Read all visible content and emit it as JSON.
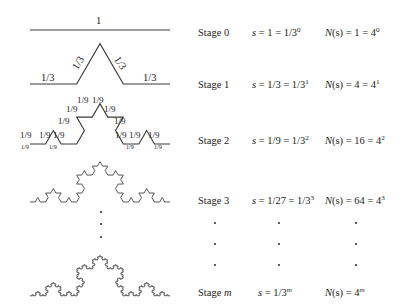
{
  "figure": {
    "line_color": "#3a3a3a",
    "background": "#ffffff"
  },
  "rows": [
    {
      "stage_label": "Stage 0",
      "s_prefix": "s",
      "s_value": "= 1 = 1/3",
      "s_exp": "0",
      "n_prefix": "N",
      "n_arg": "(s)",
      "n_value": "= 1 = 4",
      "n_exp": "0",
      "iteration": 0,
      "segment_label": "1",
      "segment_count": 1
    },
    {
      "stage_label": "Stage 1",
      "s_prefix": "s",
      "s_value": "= 1/3 = 1/3",
      "s_exp": "1",
      "n_prefix": "N",
      "n_arg": "(s)",
      "n_value": "= 4 = 4",
      "n_exp": "1",
      "iteration": 1,
      "segment_label": "1/3",
      "segment_count": 4
    },
    {
      "stage_label": "Stage 2",
      "s_prefix": "s",
      "s_value": "= 1/9 = 1/3",
      "s_exp": "2",
      "n_prefix": "N",
      "n_arg": "(s)",
      "n_value": "= 16 = 4",
      "n_exp": "2",
      "iteration": 2,
      "segment_label": "1/9",
      "segment_count": 16
    },
    {
      "stage_label": "Stage 3",
      "s_prefix": "s",
      "s_value": "= 1/27 = 1/3",
      "s_exp": "3",
      "n_prefix": "N",
      "n_arg": "(s)",
      "n_value": "= 64 = 4",
      "n_exp": "3",
      "iteration": 3,
      "segment_label": "",
      "segment_count": 64
    },
    {
      "stage_label": "Stage m",
      "stage_label_prefix": "Stage ",
      "stage_label_var": "m",
      "s_prefix": "s",
      "s_value": "= 1/3",
      "s_exp": "m",
      "n_prefix": "N",
      "n_arg": "(s)",
      "n_value": "= 4",
      "n_exp": "m",
      "iteration": 5,
      "segment_label": "",
      "segment_count": 1024
    }
  ],
  "stage1_labels": [
    "1/3",
    "1/3",
    "1/3",
    "1/3"
  ],
  "stage2_labels": [
    "1/9",
    "1/9",
    "1/9",
    "1/9",
    "1/9",
    "1/9",
    "1/9",
    "1/9",
    "1/9",
    "1/9",
    "1/9",
    "1/9",
    "1/9",
    "1/9",
    "1/9",
    "1/9"
  ],
  "ellipsis": {
    "dot_char": "·",
    "rows": 3
  }
}
